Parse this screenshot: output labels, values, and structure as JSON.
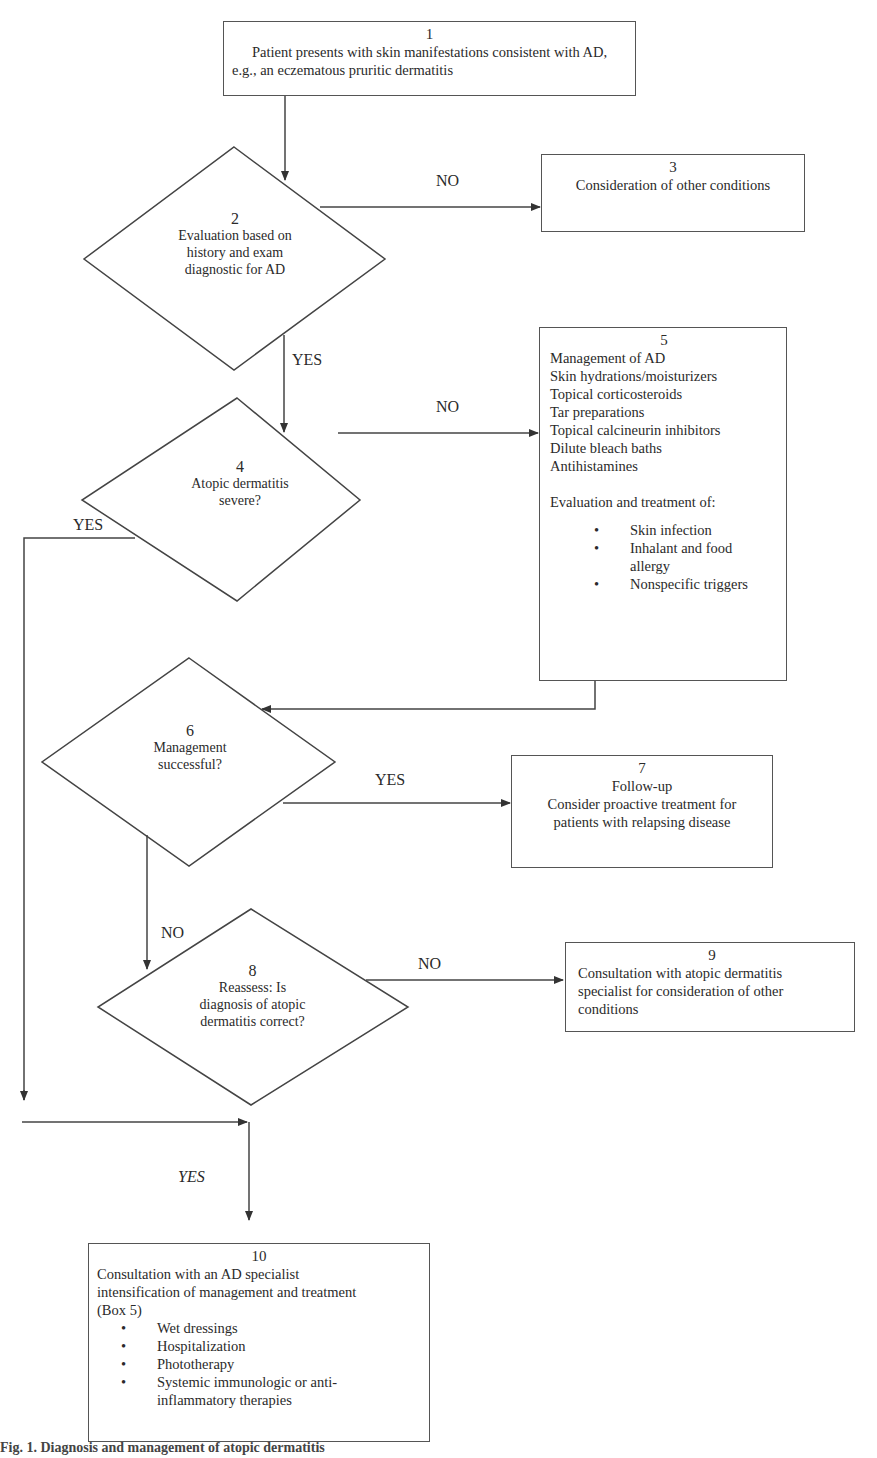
{
  "diagram": {
    "type": "flowchart",
    "nodes": [
      {
        "id": 1,
        "shape": "box",
        "number": "1",
        "lines": [
          "Patient presents with skin manifestations consistent with AD,",
          "e.g., an eczematous pruritic dermatitis"
        ]
      },
      {
        "id": 2,
        "shape": "diamond",
        "number": "2",
        "lines": [
          "Evaluation based on",
          "history and exam",
          "diagnostic for AD"
        ]
      },
      {
        "id": 3,
        "shape": "box",
        "number": "3",
        "lines": [
          "Consideration of other conditions"
        ]
      },
      {
        "id": 4,
        "shape": "diamond",
        "number": "4",
        "lines": [
          "Atopic dermatitis",
          "severe?"
        ]
      },
      {
        "id": 5,
        "shape": "box",
        "number": "5",
        "lines": [
          "Management of AD",
          "Skin hydrations/moisturizers",
          "Topical corticosteroids",
          "Tar preparations",
          "Topical calcineurin inhibitors",
          "Dilute bleach baths",
          "Antihistamines"
        ],
        "subheading": "Evaluation and treatment of:",
        "bullets": [
          "Skin infection",
          "Inhalant and food allergy",
          "Nonspecific triggers"
        ]
      },
      {
        "id": 6,
        "shape": "diamond",
        "number": "6",
        "lines": [
          "Management",
          "successful?"
        ]
      },
      {
        "id": 7,
        "shape": "box",
        "number": "7",
        "lines": [
          "Follow-up",
          "Consider proactive treatment for",
          "patients with relapsing disease"
        ]
      },
      {
        "id": 8,
        "shape": "diamond",
        "number": "8",
        "lines": [
          "Reassess: Is",
          "diagnosis of atopic",
          "dermatitis correct?"
        ]
      },
      {
        "id": 9,
        "shape": "box",
        "number": "9",
        "lines": [
          "Consultation with atopic dermatitis",
          "specialist for consideration of other",
          "conditions"
        ]
      },
      {
        "id": 10,
        "shape": "box",
        "number": "10",
        "lines": [
          "Consultation with an AD specialist",
          "intensification of management and treatment",
          "(Box 5)"
        ],
        "bullets": [
          "Wet dressings",
          "Hospitalization",
          "Phototherapy",
          "Systemic immunologic or anti-inflammatory therapies"
        ]
      }
    ],
    "edges": [
      {
        "from": 1,
        "to": 2,
        "label": ""
      },
      {
        "from": 2,
        "to": 3,
        "label": "NO"
      },
      {
        "from": 2,
        "to": 4,
        "label": "YES"
      },
      {
        "from": 4,
        "to": 5,
        "label": "NO"
      },
      {
        "from": 4,
        "to": 10,
        "label": "YES"
      },
      {
        "from": 5,
        "to": 6,
        "label": ""
      },
      {
        "from": 6,
        "to": 7,
        "label": "YES"
      },
      {
        "from": 6,
        "to": 8,
        "label": "NO"
      },
      {
        "from": 8,
        "to": 9,
        "label": "NO"
      },
      {
        "from": 8,
        "to": 10,
        "label": "YES"
      }
    ],
    "labels": {
      "no_2_3": "NO",
      "yes_2_4": "YES",
      "no_4_5": "NO",
      "yes_4_10": "YES",
      "yes_6_7": "YES",
      "no_6_8": "NO",
      "no_8_9": "NO",
      "yes_to_10": "YES"
    }
  },
  "box1": {
    "number": "1",
    "line1": "Patient presents with skin manifestations consistent with AD,",
    "line2": "e.g., an eczematous pruritic dermatitis"
  },
  "d2": {
    "number": "2",
    "line1": "Evaluation based on",
    "line2": "history and exam",
    "line3": "diagnostic for AD"
  },
  "box3": {
    "number": "3",
    "line1": "Consideration of other conditions"
  },
  "d4": {
    "number": "4",
    "line1": "Atopic dermatitis",
    "line2": "severe?"
  },
  "box5": {
    "number": "5",
    "items": [
      "Management of AD",
      "Skin hydrations/moisturizers",
      "Topical corticosteroids",
      "Tar preparations",
      "Topical calcineurin inhibitors",
      "Dilute bleach baths",
      "Antihistamines"
    ],
    "subheading": "Evaluation and treatment of:",
    "bullets": [
      "Skin infection",
      "Inhalant and food allergy",
      "Nonspecific triggers"
    ]
  },
  "d6": {
    "number": "6",
    "line1": "Management",
    "line2": "successful?"
  },
  "box7": {
    "number": "7",
    "line1": "Follow-up",
    "line2": "Consider proactive treatment for",
    "line3": "patients with relapsing disease"
  },
  "d8": {
    "number": "8",
    "line1": "Reassess: Is",
    "line2": "diagnosis of atopic",
    "line3": "dermatitis correct?"
  },
  "box9": {
    "number": "9",
    "text": "Consultation with atopic dermatitis specialist for consideration of other conditions"
  },
  "box10": {
    "number": "10",
    "line1": "Consultation with an AD specialist",
    "line2": "intensification of management and treatment",
    "line3": "(Box 5)",
    "bullets": [
      "Wet dressings",
      "Hospitalization",
      "Phototherapy",
      "Systemic immunologic or anti-inflammatory therapies"
    ]
  },
  "caption": "Fig. 1. Diagnosis and management of atopic dermatitis"
}
